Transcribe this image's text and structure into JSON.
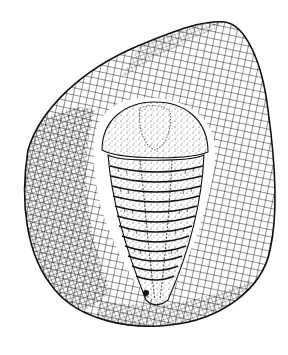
{
  "illustration": {
    "subject": "Trilobite fossil in rock slab",
    "style": "pen-and-ink crosshatch and stipple drawing",
    "colors": {
      "background": "#ffffff",
      "ink": "#111111"
    },
    "trilobite": {
      "thoracic_segments": 12
    }
  }
}
